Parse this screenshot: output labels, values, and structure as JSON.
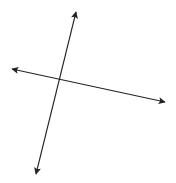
{
  "diagram": {
    "type": "intersecting-lines",
    "background_color": "#ffffff",
    "stroke_color": "#222222",
    "intersection_point": {
      "x": 59,
      "y": 79
    },
    "lines": [
      {
        "name": "steep-line",
        "start": {
          "x": 36,
          "y": 174
        },
        "end": {
          "x": 76,
          "y": 12
        },
        "arrowheads": [
          "start",
          "end"
        ]
      },
      {
        "name": "shallow-line",
        "start": {
          "x": 12,
          "y": 69
        },
        "end": {
          "x": 165,
          "y": 102
        },
        "arrowheads": [
          "start",
          "end"
        ]
      }
    ]
  }
}
